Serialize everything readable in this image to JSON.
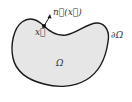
{
  "diagram": {
    "domain_label": "Ω",
    "boundary_label": "∂Ω",
    "point_label": "x⃗",
    "normal_label": "n⃗(x⃗)",
    "colors": {
      "fill": "#e6e6e6",
      "stroke": "#1a1a1a",
      "text": "#333333"
    }
  }
}
